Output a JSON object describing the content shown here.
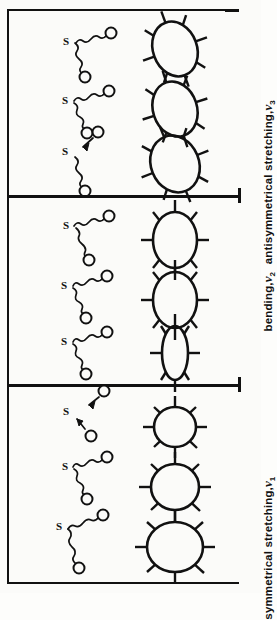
{
  "figure": {
    "orientation": "rotated-90",
    "background_color": "#fbfbf9",
    "ink_color": "#111111"
  },
  "panels": [
    {
      "id": "antisymmetrical-stretching",
      "label_text": "antisymmetrical stretching,",
      "symbol": "ν",
      "subscript": "3",
      "molecule_label_center": "S",
      "molecule_label_outer": "O",
      "molecules": [
        {
          "name": "phase-1",
          "bond_style": "spring",
          "arrows": 0
        },
        {
          "name": "phase-2",
          "bond_style": "spring",
          "arrows": 0
        },
        {
          "name": "phase-3",
          "bond_style": "spring",
          "arrows": 2
        }
      ],
      "shapes": [
        {
          "name": "tilted-ellipse-1",
          "rx": 22,
          "ry": 28,
          "rotation": -20,
          "ticks": 8
        },
        {
          "name": "tilted-ellipse-2",
          "rx": 22,
          "ry": 28,
          "rotation": -20,
          "ticks": 8
        },
        {
          "name": "tilted-ellipse-3",
          "rx": 24,
          "ry": 29,
          "rotation": -22,
          "ticks": 8
        }
      ]
    },
    {
      "id": "bending",
      "label_text": "bending,",
      "symbol": "ν",
      "subscript": "2",
      "molecule_label_center": "S",
      "molecule_label_outer": "O",
      "molecules": [
        {
          "name": "phase-1",
          "bond_style": "spring",
          "arrows": 0
        },
        {
          "name": "phase-2",
          "bond_style": "spring",
          "arrows": 0
        },
        {
          "name": "phase-3",
          "bond_style": "spring",
          "arrows": 0
        }
      ],
      "shapes": [
        {
          "name": "narrow-ellipse",
          "rx": 13,
          "ry": 27,
          "rotation": 0,
          "ticks": 8
        },
        {
          "name": "medium-ellipse",
          "rx": 22,
          "ry": 28,
          "rotation": 0,
          "ticks": 8
        },
        {
          "name": "circle",
          "rx": 27,
          "ry": 26,
          "rotation": 0,
          "ticks": 8
        }
      ]
    },
    {
      "id": "symmetrical-stretching",
      "label_text": "symmetrical stretching,",
      "symbol": "ν",
      "subscript": "1",
      "molecule_label_center": "S",
      "molecule_label_outer": "O",
      "molecules": [
        {
          "name": "phase-1",
          "bond_style": "spring",
          "arrows": 0
        },
        {
          "name": "phase-2",
          "bond_style": "spring",
          "arrows": 0
        },
        {
          "name": "phase-3",
          "bond_style": "spring",
          "arrows": 2
        }
      ],
      "shapes": [
        {
          "name": "large-circle",
          "rx": 28,
          "ry": 25,
          "rotation": 0,
          "ticks": 8
        },
        {
          "name": "medium-circle",
          "rx": 24,
          "ry": 23,
          "rotation": 0,
          "ticks": 8
        },
        {
          "name": "small-circle",
          "rx": 21,
          "ry": 20,
          "rotation": 0,
          "ticks": 8
        }
      ]
    }
  ]
}
